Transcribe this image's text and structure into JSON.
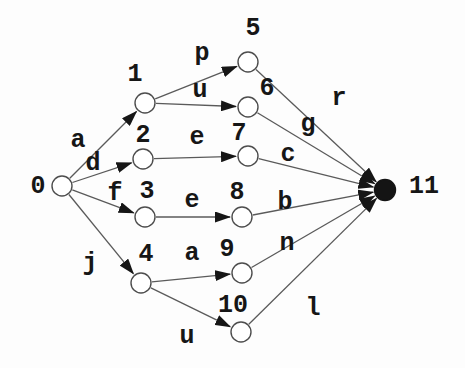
{
  "diagram": {
    "type": "directed-graph",
    "start_node_id": "0",
    "final_node_id": "11",
    "background": "#fdfdfd",
    "node_radius": 10,
    "colors": {
      "edge_line": "#5a5a5a",
      "arrowhead": "#161616",
      "node_stroke": "#4d4d4d",
      "node_fill": "#ffffff",
      "final_node_fill": "#141414",
      "label_text": "#161616"
    },
    "nodes": [
      {
        "id": "0",
        "label": "0",
        "x": 62,
        "y": 186,
        "label_x": 38,
        "label_y": 185,
        "filled": false
      },
      {
        "id": "1",
        "label": "1",
        "x": 145,
        "y": 103,
        "label_x": 135,
        "label_y": 73,
        "filled": false
      },
      {
        "id": "2",
        "label": "2",
        "x": 143,
        "y": 159,
        "label_x": 143,
        "label_y": 134,
        "filled": false
      },
      {
        "id": "3",
        "label": "3",
        "x": 145,
        "y": 217,
        "label_x": 147,
        "label_y": 190,
        "filled": false
      },
      {
        "id": "4",
        "label": "4",
        "x": 141,
        "y": 283,
        "label_x": 146,
        "label_y": 253,
        "filled": false
      },
      {
        "id": "5",
        "label": "5",
        "x": 248,
        "y": 62,
        "label_x": 253,
        "label_y": 27,
        "filled": false
      },
      {
        "id": "6",
        "label": "6",
        "x": 248,
        "y": 107,
        "label_x": 267,
        "label_y": 87,
        "filled": false
      },
      {
        "id": "7",
        "label": "7",
        "x": 248,
        "y": 156,
        "label_x": 239,
        "label_y": 132,
        "filled": false
      },
      {
        "id": "8",
        "label": "8",
        "x": 242,
        "y": 217,
        "label_x": 237,
        "label_y": 191,
        "filled": false
      },
      {
        "id": "9",
        "label": "9",
        "x": 242,
        "y": 273,
        "label_x": 227,
        "label_y": 248,
        "filled": false
      },
      {
        "id": "10",
        "label": "10",
        "x": 241,
        "y": 332,
        "label_x": 233,
        "label_y": 304,
        "filled": false
      },
      {
        "id": "11",
        "label": "11",
        "x": 385,
        "y": 190,
        "label_x": 424,
        "label_y": 185,
        "filled": true
      }
    ],
    "edges": [
      {
        "from": "0",
        "to": "1",
        "label": "a",
        "label_x": 78,
        "label_y": 139
      },
      {
        "from": "0",
        "to": "2",
        "label": "d",
        "label_x": 93,
        "label_y": 162
      },
      {
        "from": "0",
        "to": "3",
        "label": "f",
        "label_x": 115,
        "label_y": 192
      },
      {
        "from": "0",
        "to": "4",
        "label": "j",
        "label_x": 90,
        "label_y": 262
      },
      {
        "from": "1",
        "to": "5",
        "label": "p",
        "label_x": 202,
        "label_y": 52
      },
      {
        "from": "1",
        "to": "6",
        "label": "u",
        "label_x": 200,
        "label_y": 89
      },
      {
        "from": "2",
        "to": "7",
        "label": "e",
        "label_x": 197,
        "label_y": 136
      },
      {
        "from": "3",
        "to": "8",
        "label": "e",
        "label_x": 192,
        "label_y": 199
      },
      {
        "from": "4",
        "to": "9",
        "label": "a",
        "label_x": 192,
        "label_y": 252
      },
      {
        "from": "4",
        "to": "10",
        "label": "u",
        "label_x": 187,
        "label_y": 335
      },
      {
        "from": "5",
        "to": "11",
        "label": "r",
        "label_x": 339,
        "label_y": 97
      },
      {
        "from": "6",
        "to": "11",
        "label": "g",
        "label_x": 308,
        "label_y": 123
      },
      {
        "from": "7",
        "to": "11",
        "label": "c",
        "label_x": 288,
        "label_y": 153
      },
      {
        "from": "8",
        "to": "11",
        "label": "b",
        "label_x": 285,
        "label_y": 201
      },
      {
        "from": "9",
        "to": "11",
        "label": "n",
        "label_x": 287,
        "label_y": 242
      },
      {
        "from": "10",
        "to": "11",
        "label": "l",
        "label_x": 313,
        "label_y": 307
      }
    ]
  }
}
